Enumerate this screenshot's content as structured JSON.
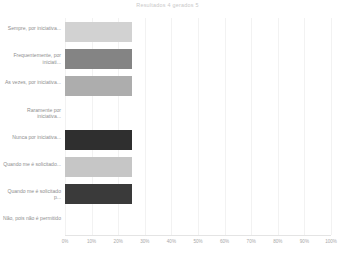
{
  "chart_data": {
    "type": "bar",
    "orientation": "horizontal",
    "title": "Resultados 4 gerados 5",
    "xlabel": "",
    "ylabel": "",
    "xlim": [
      0,
      100
    ],
    "grid": true,
    "legend": false,
    "categories": [
      "Sempre, por iniciativa...",
      "Frequentemente, por iniciati...",
      "As vezes, por iniciativa...",
      "Raramente por iniciativa...",
      "Nunca por iniciativa...",
      "Quando me é solicitado...",
      "Quando me é solicitado p...",
      "Não, pois não é permitido"
    ],
    "values": [
      25,
      25,
      25,
      0,
      25,
      25,
      25,
      0
    ],
    "bar_colors": [
      "#d2d2d2",
      "#848484",
      "#adadad",
      "#ffffff",
      "#2f2f2f",
      "#c6c6c6",
      "#3a3a3a",
      "#ffffff"
    ],
    "tick_labels": [
      "0%",
      "10%",
      "20%",
      "30%",
      "40%",
      "50%",
      "60%",
      "70%",
      "80%",
      "90%",
      "100%"
    ],
    "tick_values": [
      0,
      10,
      20,
      30,
      40,
      50,
      60,
      70,
      80,
      90,
      100
    ]
  },
  "colors": {
    "background": "#ffffff",
    "gridline": "#f2f2f2",
    "axis": "#e4e4e4",
    "label_text": "#8e8e8e",
    "tick_text": "#a8a8a8",
    "title_text": "#c9c9c9"
  }
}
